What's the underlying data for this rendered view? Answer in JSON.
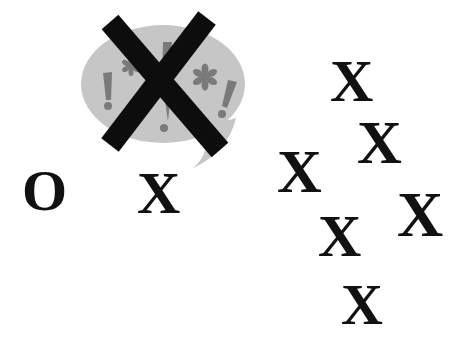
{
  "illustration": {
    "speech_bubble": {
      "symbols": [
        "!",
        "*",
        "!",
        "*",
        "!"
      ],
      "bubble_color": "#c6c6c6",
      "symbol_color": "#7a7a7a",
      "crossed_out": true,
      "cross_color": "#0d0d0d"
    },
    "left_row": {
      "o_mark": "O",
      "x_mark": "X"
    },
    "x_cluster": [
      "X",
      "X",
      "X",
      "X",
      "X",
      "X"
    ]
  }
}
